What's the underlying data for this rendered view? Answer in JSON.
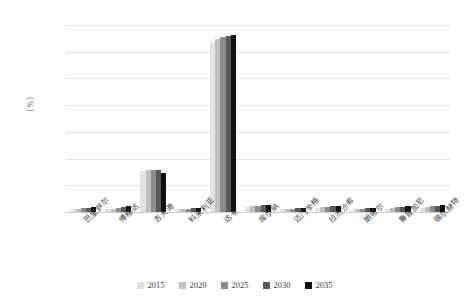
{
  "chart_data": {
    "type": "bar",
    "title": "",
    "subtitle": "",
    "xlabel": "",
    "ylabel": "（%）",
    "ylim": [
      0,
      35
    ],
    "ytick_step": 5,
    "ytick_labels": [
      "0.0",
      "5.0",
      "10.0",
      "15.0",
      "20.0",
      "25.0",
      "30.0",
      "35.0"
    ],
    "grid": true,
    "legend_position": "bottom",
    "categories": [
      "巴里萨尔",
      "博格达",
      "吉大港",
      "科米利亚",
      "达卡",
      "库尔纳",
      "迈门辛格",
      "拉杰沙希",
      "朗布尔",
      "鲁普加尼",
      "锡尔赫特"
    ],
    "series": [
      {
        "name": "2015",
        "color": "#e2e2e2",
        "values": [
          0.5,
          0.5,
          7.6,
          0.5,
          31.8,
          1.0,
          0.5,
          0.8,
          0.4,
          0.6,
          0.8
        ]
      },
      {
        "name": "2020",
        "color": "#bfbfbf",
        "values": [
          0.6,
          0.6,
          7.9,
          0.5,
          32.3,
          1.1,
          0.5,
          0.9,
          0.5,
          0.7,
          0.9
        ]
      },
      {
        "name": "2025",
        "color": "#8c8c8c",
        "values": [
          0.7,
          0.8,
          7.9,
          0.6,
          32.7,
          1.2,
          0.6,
          1.0,
          0.6,
          0.9,
          1.1
        ]
      },
      {
        "name": "2030",
        "color": "#595959",
        "values": [
          0.8,
          0.9,
          7.8,
          0.7,
          33.0,
          1.3,
          0.7,
          1.1,
          0.7,
          1.0,
          1.2
        ]
      },
      {
        "name": "2035",
        "color": "#101010",
        "values": [
          0.9,
          1.1,
          7.3,
          0.8,
          33.1,
          1.4,
          0.8,
          1.2,
          0.8,
          1.2,
          1.3
        ]
      }
    ]
  }
}
